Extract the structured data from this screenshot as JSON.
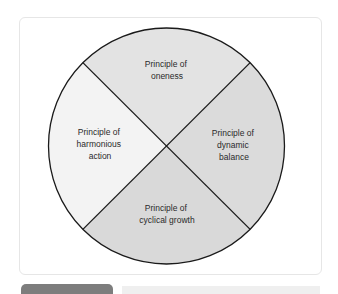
{
  "diagram": {
    "type": "four-quadrant-circle",
    "quadrants": [
      {
        "position": "top",
        "lines": [
          "Principle of",
          "oneness"
        ],
        "fill": "#e3e3e3"
      },
      {
        "position": "right",
        "lines": [
          "Principle of",
          "dynamic",
          "balance"
        ],
        "fill": "#dbdbdb"
      },
      {
        "position": "bottom",
        "lines": [
          "Principle of",
          "cyclical growth"
        ],
        "fill": "#d9d9d9"
      },
      {
        "position": "left",
        "lines": [
          "Principle of",
          "harmonious",
          "action"
        ],
        "fill": "#f3f3f3"
      }
    ],
    "stroke_color": "#1a1a1a"
  }
}
